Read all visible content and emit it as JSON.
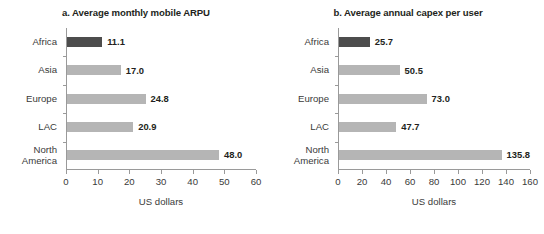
{
  "chart_data": [
    {
      "type": "bar",
      "orientation": "horizontal",
      "panel_label": "a.",
      "title": "a. Average monthly mobile ARPU",
      "xlabel": "US dollars",
      "ylabel": "",
      "categories": [
        "Africa",
        "Asia",
        "Europe",
        "LAC",
        "North\nAmerica"
      ],
      "values": [
        11.1,
        17.0,
        24.8,
        20.9,
        48.0
      ],
      "value_labels": [
        "11.1",
        "17.0",
        "24.8",
        "20.9",
        "48.0"
      ],
      "xlim": [
        0,
        60
      ],
      "xticks": [
        0,
        10,
        20,
        30,
        40,
        50,
        60
      ],
      "xticklabels": [
        "0",
        "10",
        "20",
        "30",
        "40",
        "50",
        "60"
      ],
      "grid": false,
      "legend": false,
      "bar_color": "#b5b5b5",
      "highlight_color": "#4d4d4d",
      "highlight_category": "Africa"
    },
    {
      "type": "bar",
      "orientation": "horizontal",
      "panel_label": "b.",
      "title": "b. Average annual capex per user",
      "xlabel": "US dollars",
      "ylabel": "",
      "categories": [
        "Africa",
        "Asia",
        "Europe",
        "LAC",
        "North\nAmerica"
      ],
      "values": [
        25.7,
        50.5,
        73.0,
        47.7,
        135.8
      ],
      "value_labels": [
        "25.7",
        "50.5",
        "73.0",
        "47.7",
        "135.8"
      ],
      "xlim": [
        0,
        160
      ],
      "xticks": [
        0,
        20,
        40,
        60,
        80,
        100,
        120,
        140,
        160
      ],
      "xticklabels": [
        "0",
        "20",
        "40",
        "60",
        "80",
        "100",
        "120",
        "140",
        "160"
      ],
      "grid": false,
      "legend": false,
      "bar_color": "#b5b5b5",
      "highlight_color": "#4d4d4d",
      "highlight_category": "Africa"
    }
  ]
}
